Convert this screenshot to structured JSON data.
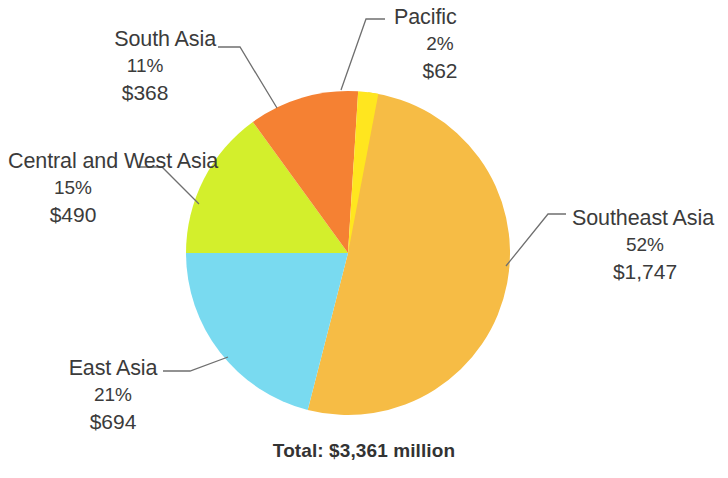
{
  "chart_data": {
    "type": "pie",
    "title": "",
    "subtitle": "",
    "total_label": "Total: $3,361 million",
    "total_value": 3361,
    "units": "$ million",
    "legend": "callout-labels",
    "categories": [
      "Southeast Asia",
      "East Asia",
      "Central and West Asia",
      "South Asia",
      "Pacific"
    ],
    "values": [
      1747,
      694,
      490,
      368,
      62
    ],
    "percentages": [
      52,
      21,
      15,
      11,
      2
    ],
    "colors": [
      "#f6bc45",
      "#79daf0",
      "#d3ef2c",
      "#f58133",
      "#ffe61f"
    ],
    "slices": [
      {
        "name": "Southeast Asia",
        "percent_label": "52%",
        "value_label": "$1,747",
        "percent": 52,
        "value": 1747,
        "color": "#f6bc45",
        "start_deg": 7.2,
        "end_deg": 194.4
      },
      {
        "name": "East Asia",
        "percent_label": "21%",
        "value_label": "$694",
        "percent": 21,
        "value": 694,
        "color": "#79daf0",
        "start_deg": 194.4,
        "end_deg": 270.0
      },
      {
        "name": "Central and West Asia",
        "percent_label": "15%",
        "value_label": "$490",
        "percent": 15,
        "value": 490,
        "color": "#d3ef2c",
        "start_deg": 270.0,
        "end_deg": 324.0
      },
      {
        "name": "South Asia",
        "percent_label": "11%",
        "value_label": "$368",
        "percent": 11,
        "value": 368,
        "color": "#f58133",
        "start_deg": 324.0,
        "end_deg": 363.6
      },
      {
        "name": "Pacific",
        "percent_label": "2%",
        "value_label": "$62",
        "percent": 2,
        "value": 62,
        "color": "#ffe61f",
        "start_deg": 363.6,
        "end_deg": 370.8
      }
    ],
    "geometry": {
      "center_x": 348,
      "center_y": 253,
      "radius": 162
    },
    "leader_line_color": "#6f6f6f",
    "background_color": "#ffffff",
    "text_color": "#3b3b3b"
  }
}
